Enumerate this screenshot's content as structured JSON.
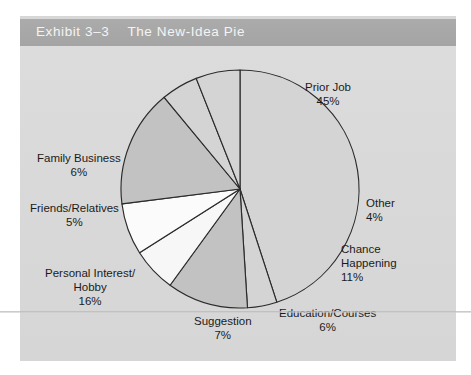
{
  "figure": {
    "exhibit_number": "Exhibit 3–3",
    "title": "The New-Idea Pie",
    "band_color": "#a6a6a6",
    "panel_color": "#dcdcdc"
  },
  "chart_data": {
    "type": "pie",
    "title": "The New-Idea Pie",
    "xlabel": "",
    "ylabel": "",
    "legend_position": "none",
    "grid": false,
    "total": 100,
    "unit": "%",
    "categories": [
      "Prior Job",
      "Other",
      "Chance Happening",
      "Education/Courses",
      "Suggestion",
      "Personal Interest/Hobby",
      "Friends/Relatives",
      "Family Business"
    ],
    "values": [
      45,
      4,
      11,
      6,
      7,
      16,
      5,
      6
    ],
    "slices": [
      {
        "label": "Prior Job",
        "label_line1": "Prior Job",
        "value": 45,
        "value_text": "45%",
        "color": "#d4d4d4",
        "start_angle": 270,
        "end_angle": 432
      },
      {
        "label": "Other",
        "label_line1": "Other",
        "value": 4,
        "value_text": "4%",
        "color": "#d4d4d4",
        "start_angle": 432,
        "end_angle": 446.4
      },
      {
        "label": "Chance Happening",
        "label_line1": "Chance",
        "label_line2": "Happening",
        "value": 11,
        "value_text": "11%",
        "color": "#c2c2c2",
        "start_angle": 446.4,
        "end_angle": 486
      },
      {
        "label": "Education/Courses",
        "label_line1": "Education/Courses",
        "value": 6,
        "value_text": "6%",
        "color": "#f7f7f7",
        "start_angle": 486,
        "end_angle": 507.6
      },
      {
        "label": "Suggestion",
        "label_line1": "Suggestion",
        "value": 7,
        "value_text": "7%",
        "color": "#fbfbfb",
        "start_angle": 507.6,
        "end_angle": 532.8
      },
      {
        "label": "Personal Interest/Hobby",
        "label_line1": "Personal Interest/",
        "label_line2": "Hobby",
        "value": 16,
        "value_text": "16%",
        "color": "#c2c2c2",
        "start_angle": 532.8,
        "end_angle": 590.4
      },
      {
        "label": "Friends/Relatives",
        "label_line1": "Friends/Relatives",
        "value": 5,
        "value_text": "5%",
        "color": "#d4d4d4",
        "start_angle": 590.4,
        "end_angle": 608.4
      },
      {
        "label": "Family Business",
        "label_line1": "Family Business",
        "value": 6,
        "value_text": "6%",
        "color": "#d4d4d4",
        "start_angle": 608.4,
        "end_angle": 630
      }
    ],
    "geometry": {
      "center_x": 240,
      "center_y": 189,
      "radius": 119
    }
  }
}
